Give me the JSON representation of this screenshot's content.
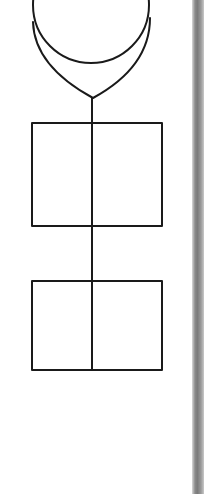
{
  "diagram": {
    "stroke_color": "#1a1a1a",
    "stroke_width": 2,
    "background": "#ffffff",
    "edge_strip_color": "#8a8a8a",
    "shapes": [
      {
        "id": "circle-head",
        "type": "circle",
        "cx": 91,
        "cy": 5,
        "r": 58
      },
      {
        "id": "v-outline",
        "type": "path",
        "d": "M33 22 C 34 55, 60 80, 93 98 C 126 80, 150 55, 150 18"
      },
      {
        "id": "box-top",
        "type": "rect",
        "x": 32,
        "y": 123,
        "w": 130,
        "h": 103
      },
      {
        "id": "box-bottom",
        "type": "rect",
        "x": 32,
        "y": 281,
        "w": 130,
        "h": 89
      },
      {
        "id": "spine-line",
        "type": "line",
        "x1": 92,
        "y1": 98,
        "x2": 92,
        "y2": 370
      }
    ]
  }
}
